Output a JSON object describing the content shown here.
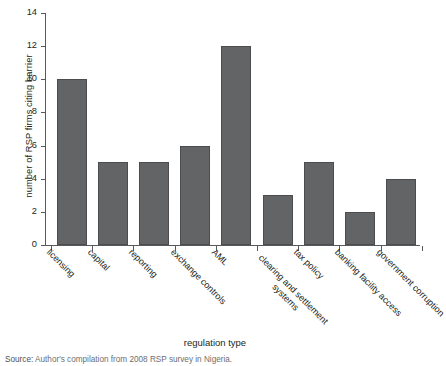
{
  "chart_data": {
    "type": "bar",
    "title": "",
    "xlabel": "regulation type",
    "ylabel": "number of RSP firms citing barrier",
    "categories": [
      "licensing",
      "capital",
      "reporting",
      "exchange controls",
      "AML",
      "clearing and settlement systems",
      "tax policy",
      "banking facility access",
      "government corruption"
    ],
    "values": [
      10,
      5,
      5,
      6,
      12,
      3,
      5,
      2,
      4
    ],
    "ylim": [
      0,
      14
    ],
    "yticks": [
      0,
      2,
      4,
      6,
      8,
      10,
      12,
      14
    ],
    "ytick_labels": [
      "0",
      "2",
      "4",
      "6",
      "8",
      "10",
      "12",
      "14"
    ],
    "grid": false,
    "legend": false,
    "bar_color": "#636466",
    "axis_color": "#58595b"
  },
  "source_note": {
    "prefix": "Source:",
    "text": "Author's compilation from 2008 RSP survey in Nigeria."
  }
}
